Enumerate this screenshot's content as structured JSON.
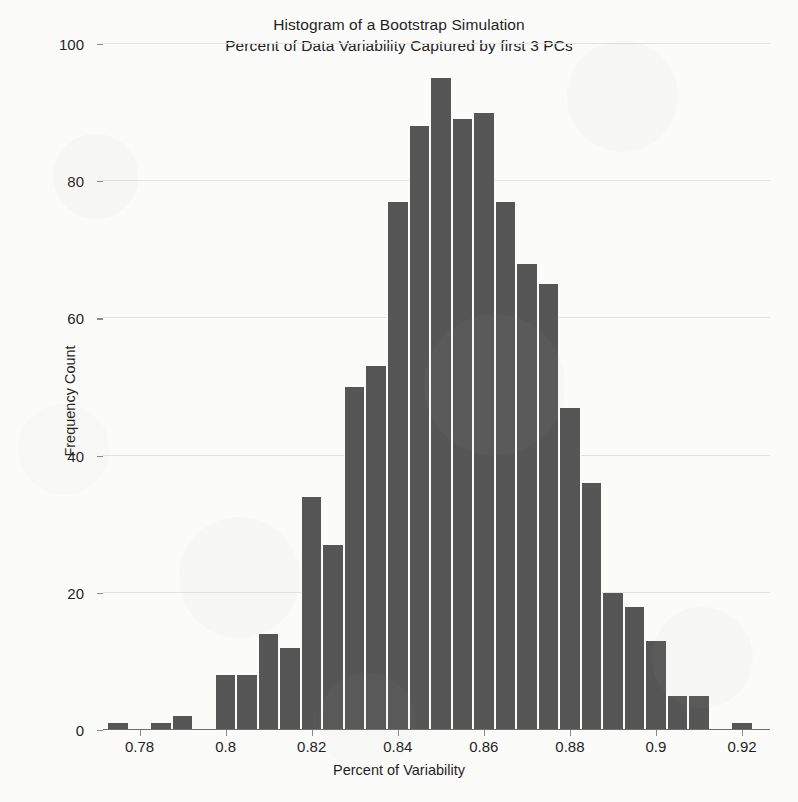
{
  "chart_data": {
    "type": "bar",
    "title": "Histogram of a Bootstrap Simulation",
    "subtitle": "Percent of Data Variability Captured by first 3 PCs",
    "xlabel": "Percent of Variability",
    "ylabel": "Frequency Count",
    "xlim": [
      0.7715,
      0.9265
    ],
    "ylim": [
      0,
      100
    ],
    "grid": true,
    "legend": false,
    "bin_width": 0.005,
    "bar_color": "#565656",
    "background_color": "#fbfbfa",
    "gridline_color": "#e3e3e1",
    "xticks": [
      0.78,
      0.8,
      0.82,
      0.84,
      0.86,
      0.88,
      0.9,
      0.92
    ],
    "xtick_labels": [
      "0.78",
      "0.8",
      "0.82",
      "0.84",
      "0.86",
      "0.88",
      "0.9",
      "0.92"
    ],
    "yticks": [
      0,
      20,
      40,
      60,
      80,
      100
    ],
    "ytick_labels": [
      "0",
      "20",
      "40",
      "60",
      "80",
      "100"
    ],
    "bin_starts": [
      0.7725,
      0.7775,
      0.7825,
      0.7875,
      0.7925,
      0.7975,
      0.8025,
      0.8075,
      0.8125,
      0.8175,
      0.8225,
      0.8275,
      0.8325,
      0.8375,
      0.8425,
      0.8475,
      0.8525,
      0.8575,
      0.8625,
      0.8675,
      0.8725,
      0.8775,
      0.8825,
      0.8875,
      0.8925,
      0.8975,
      0.9025,
      0.9075,
      0.9125,
      0.9175,
      0.9225
    ],
    "categories": [
      "0.7725",
      "0.7775",
      "0.7825",
      "0.7875",
      "0.7925",
      "0.7975",
      "0.8025",
      "0.8075",
      "0.8125",
      "0.8175",
      "0.8225",
      "0.8275",
      "0.8325",
      "0.8375",
      "0.8425",
      "0.8475",
      "0.8525",
      "0.8575",
      "0.8625",
      "0.8675",
      "0.8725",
      "0.8775",
      "0.8825",
      "0.8875",
      "0.8925",
      "0.8975",
      "0.9025",
      "0.9075",
      "0.9125",
      "0.9175",
      "0.9225"
    ],
    "values": [
      1,
      0,
      1,
      2,
      0,
      8,
      8,
      14,
      12,
      34,
      27,
      50,
      53,
      77,
      88,
      95,
      89,
      90,
      77,
      68,
      65,
      47,
      36,
      20,
      18,
      13,
      5,
      5,
      0,
      1,
      0
    ]
  }
}
